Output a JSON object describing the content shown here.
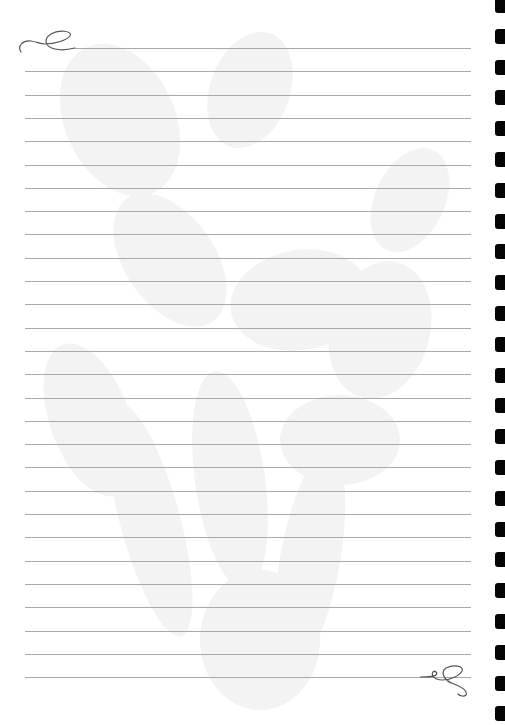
{
  "page": {
    "type": "lined-notepaper",
    "background_color": "#ffffff",
    "watermark": "faint-floral-lilies",
    "watermark_color": "#f1f1f1"
  },
  "rules": {
    "count": 28,
    "first_y": 48,
    "spacing": 23.3,
    "left_x": 25,
    "first_line_left_x": 75,
    "right_x": 471,
    "color": "#a9a9a9"
  },
  "binding_holes": {
    "count": 24,
    "first_y": -2,
    "spacing": 30.8,
    "x": 495,
    "color": "#050505"
  },
  "ornaments": {
    "top_left": "swirl-flourish",
    "bottom_right": "swirl-flourish",
    "color": "#555555"
  }
}
